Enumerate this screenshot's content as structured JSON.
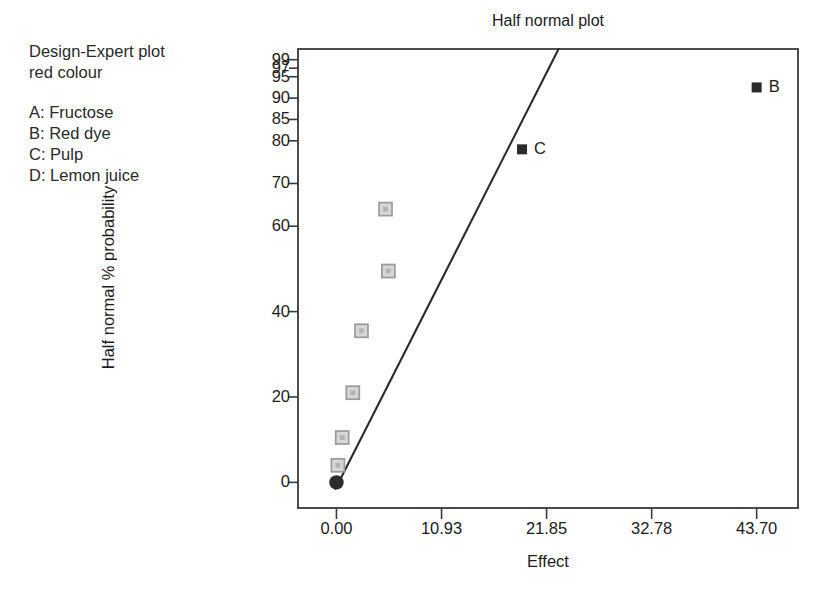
{
  "chart_data": {
    "type": "scatter",
    "title": "Half normal plot",
    "xlabel": "Effect",
    "ylabel": "Half normal % probability",
    "xlim": [
      -4.0,
      48.0
    ],
    "ylim": [
      -6.0,
      101.5
    ],
    "grid": false,
    "legend_position": "upper-left-outside",
    "x_ticks": [
      "0.00",
      "10.93",
      "21.85",
      "32.78",
      "43.70"
    ],
    "x_tick_values": [
      0.0,
      10.93,
      21.85,
      32.78,
      43.7
    ],
    "y_ticks": [
      "0",
      "20",
      "40",
      "60",
      "70",
      "80",
      "85",
      "90",
      "95",
      "97",
      "99"
    ],
    "y_tick_values": [
      0,
      20,
      40,
      60,
      70,
      80,
      85,
      90,
      95,
      97,
      99
    ],
    "series": [
      {
        "name": "unlabeled effects",
        "marker": "square-open",
        "color": "#9a9a9a",
        "points": [
          {
            "x": 0.15,
            "y": 4.0,
            "label": ""
          },
          {
            "x": 0.6,
            "y": 10.5,
            "label": ""
          },
          {
            "x": 1.7,
            "y": 21.0,
            "label": ""
          },
          {
            "x": 2.6,
            "y": 35.5,
            "label": ""
          },
          {
            "x": 5.4,
            "y": 49.5,
            "label": ""
          },
          {
            "x": 5.1,
            "y": 64.0,
            "label": ""
          }
        ]
      },
      {
        "name": "labeled effects",
        "marker": "square-filled",
        "color": "#2b2b2b",
        "points": [
          {
            "x": 19.3,
            "y": 78.0,
            "label": "C"
          },
          {
            "x": 43.7,
            "y": 92.5,
            "label": "B"
          }
        ]
      },
      {
        "name": "origin point",
        "marker": "circle-filled",
        "color": "#2b2b2b",
        "points": [
          {
            "x": 0.0,
            "y": 0.0,
            "label": ""
          }
        ]
      }
    ],
    "reference_line": {
      "name": "half-normal reference line",
      "color": "#2b2b2b",
      "from": {
        "x": -0.1,
        "y": -1.5
      },
      "to": {
        "x": 23.1,
        "y": 101.5
      }
    }
  },
  "annotations": {
    "header_line_1": "Design-Expert plot",
    "header_line_2": "red colour",
    "factors": [
      {
        "key": "A:",
        "name": "Fructose"
      },
      {
        "key": "B:",
        "name": "Red dye"
      },
      {
        "key": "C:",
        "name": "Pulp"
      },
      {
        "key": "D:",
        "name": "Lemon juice"
      }
    ]
  },
  "style": {
    "frame_color": "#3a3a3a",
    "background": "#ffffff",
    "text_color": "#1c1c1c"
  }
}
